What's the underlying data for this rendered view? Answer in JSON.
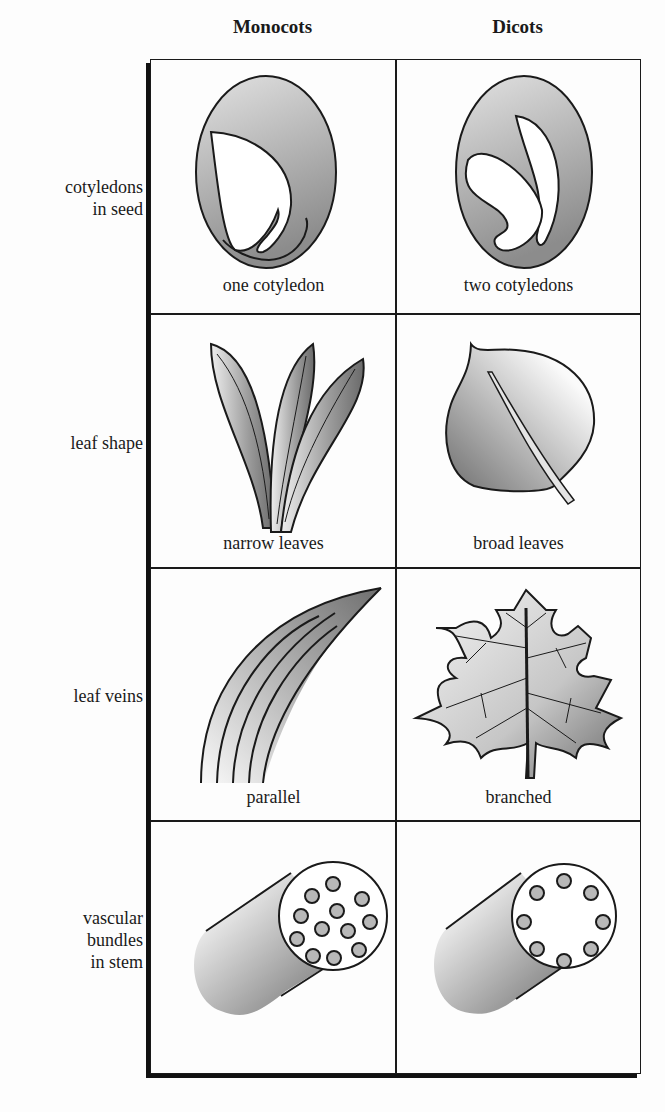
{
  "columns": [
    {
      "label": "Monocots"
    },
    {
      "label": "Dicots"
    }
  ],
  "rows": [
    {
      "label_lines": [
        "cotyledons",
        "in seed"
      ],
      "monocot": "one cotyledon",
      "dicot": "two cotyledons"
    },
    {
      "label_lines": [
        "leaf shape"
      ],
      "monocot": "narrow leaves",
      "dicot": "broad leaves"
    },
    {
      "label_lines": [
        "leaf veins"
      ],
      "monocot": "parallel",
      "dicot": "branched"
    },
    {
      "label_lines": [
        "vascular",
        "bundles",
        "in stem"
      ],
      "monocot": "",
      "dicot": ""
    }
  ],
  "colors": {
    "line": "#1a1a1a",
    "fill_dark": "#7a7a7a",
    "fill_light": "#f2f2f2",
    "background": "#fdfdfd"
  }
}
